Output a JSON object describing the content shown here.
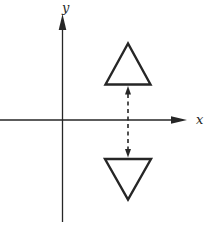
{
  "figure": {
    "background_color": "#ffffff",
    "line_color": "#262626",
    "axes": {
      "x_label": "x",
      "y_label": "y",
      "x_axis": {
        "path": "M 0 120 L 176 120",
        "arrowhead": "187,120 171,116.3 171,123.7"
      },
      "y_axis": {
        "path": "M 62.5 222 L 62.5 27",
        "arrowhead": "62.5,14 58.7,30 66.3,30"
      },
      "origin": {
        "x": 62.5,
        "y": 120
      }
    },
    "shapes": {
      "upper_triangle": {
        "description": "triangle above x-axis, apex pointing up",
        "points": "128,43.5 105.5,84.5 150.5,84.5"
      },
      "lower_triangle": {
        "description": "reflected triangle below x-axis, apex pointing down",
        "points": "105,159 151,159 128,199.5"
      },
      "reflection_arrow": {
        "description": "vertical dashed double-headed arrow between the two triangles crossing the x-axis",
        "path": "M 128 94 L 128 150",
        "dash": "4 3.5",
        "head_top": "128,86 125,94.5 131,94.5",
        "head_bottom": "128,157.5 125,149 131,149"
      }
    },
    "labels": {
      "x_label_pos": {
        "x": 196,
        "y": 124
      },
      "y_label_pos": {
        "x": 62,
        "y": 12
      }
    }
  }
}
